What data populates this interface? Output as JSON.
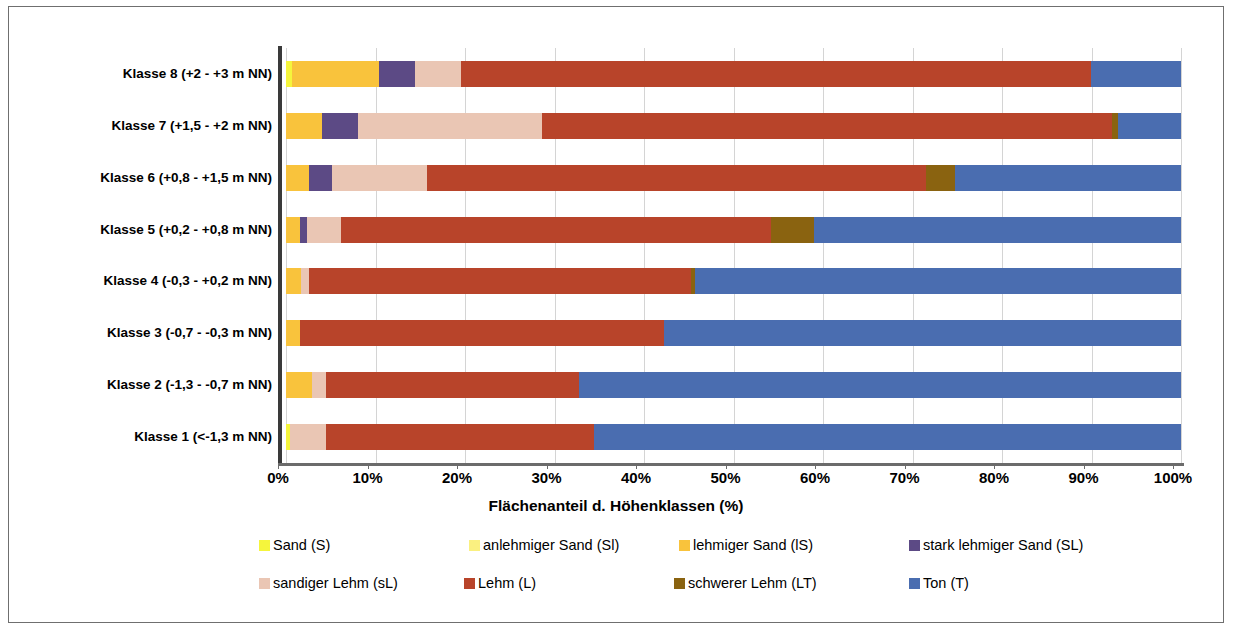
{
  "chart_data": {
    "type": "bar",
    "orientation": "horizontal",
    "stacked": true,
    "normalized_percent": true,
    "title": "",
    "xlabel": "Flächenanteil d. Höhenklassen (%)",
    "ylabel": "",
    "xlim": [
      0,
      100
    ],
    "xticks": [
      "0%",
      "10%",
      "20%",
      "30%",
      "40%",
      "50%",
      "60%",
      "70%",
      "80%",
      "90%",
      "100%"
    ],
    "xtick_values": [
      0,
      10,
      20,
      30,
      40,
      50,
      60,
      70,
      80,
      90,
      100
    ],
    "grid": "vertical",
    "legend_position": "bottom",
    "categories": [
      "Klasse 8 (+2 - +3  m NN)",
      "Klasse 7 (+1,5 - +2  m NN)",
      "Klasse 6 (+0,8 - +1,5 m NN)",
      "Klasse 5 (+0,2 - +0,8  m NN)",
      "Klasse 4 (-0,3 - +0,2  m NN)",
      "Klasse 3 (-0,7 - -0,3  m NN)",
      "Klasse 2 (-1,3 - -0,7  m NN)",
      "Klasse 1 (<-1,3  m NN)"
    ],
    "series": [
      {
        "name": "Sand (S)",
        "color": "#F5F53C",
        "values": [
          0.7,
          0.0,
          0.0,
          0.0,
          0.0,
          0.0,
          0.0,
          0.4
        ]
      },
      {
        "name": "anlehmiger Sand (Sl)",
        "color": "#FAF080",
        "values": [
          0.0,
          0.0,
          0.0,
          0.0,
          0.0,
          0.0,
          0.0,
          0.0
        ]
      },
      {
        "name": "lehmiger Sand (lS)",
        "color": "#F9C33C",
        "values": [
          9.7,
          4.0,
          2.6,
          1.6,
          1.7,
          1.6,
          2.9,
          0.0
        ]
      },
      {
        "name": "stark lehmiger Sand (SL)",
        "color": "#5C4A85",
        "values": [
          4.0,
          4.1,
          2.5,
          0.8,
          0.0,
          0.0,
          0.0,
          0.0
        ]
      },
      {
        "name": "sandiger Lehm (sL)",
        "color": "#EAC6B4",
        "values": [
          5.1,
          20.5,
          10.7,
          3.8,
          0.9,
          0.0,
          1.6,
          4.1
        ]
      },
      {
        "name": "Lehm (L)",
        "color": "#B8442A",
        "values": [
          70.5,
          63.7,
          55.7,
          48.0,
          42.7,
          40.6,
          28.2,
          29.9
        ]
      },
      {
        "name": "schwerer Lehm (LT)",
        "color": "#8A6310",
        "values": [
          0.0,
          0.7,
          3.3,
          4.8,
          0.4,
          0.0,
          0.0,
          0.0
        ]
      },
      {
        "name": "Ton (T)",
        "color": "#4A6DB0",
        "values": [
          10.0,
          7.0,
          25.2,
          41.0,
          54.3,
          57.8,
          67.3,
          65.6
        ]
      }
    ]
  }
}
